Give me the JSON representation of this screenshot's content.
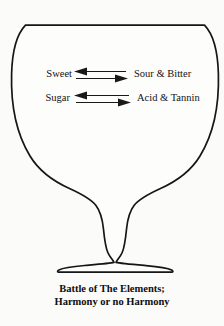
{
  "figure": {
    "name": "wine-glass-balance-diagram",
    "background_color": "#fbfbfa",
    "ink_color": "#161616",
    "glass": {
      "shape": "wine-glass-outline",
      "fill_color": "#fdfdfc",
      "stroke_color": "#161616"
    },
    "rows": [
      {
        "id": "row-sweet",
        "left_label": "Sweet",
        "right_label": "Sour & Bitter",
        "arrows": "bidirectional-pair"
      },
      {
        "id": "row-sugar",
        "left_label": "Sugar",
        "right_label": "Acid & Tannin",
        "arrows": "bidirectional-pair"
      }
    ],
    "caption": {
      "line1": "Battle of The Elements;",
      "line2": "Harmony or no Harmony"
    }
  }
}
